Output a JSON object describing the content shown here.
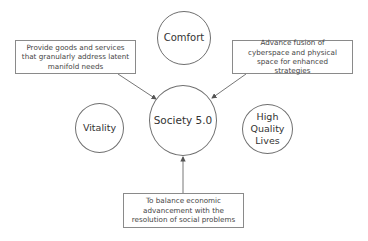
{
  "diagram": {
    "center": {
      "label": "Society 5.0"
    },
    "circles": [
      {
        "id": "comfort",
        "label": "Comfort"
      },
      {
        "id": "vitality",
        "label": "Vitality"
      },
      {
        "id": "high-quality-lives",
        "label": "High Quality Lives"
      }
    ],
    "boxes": [
      {
        "id": "goods-services",
        "text": "Provide goods and services that granularly address latent manifold needs"
      },
      {
        "id": "cyber-physical",
        "text": "Advance fusion of cyberspace and physical space for enhanced strategies"
      },
      {
        "id": "balance",
        "text": "To balance economic advancement with the resolution of social problems"
      }
    ],
    "colors": {
      "stroke": "#6f6f6f",
      "arrow": "#555555",
      "text": "#333333"
    }
  }
}
